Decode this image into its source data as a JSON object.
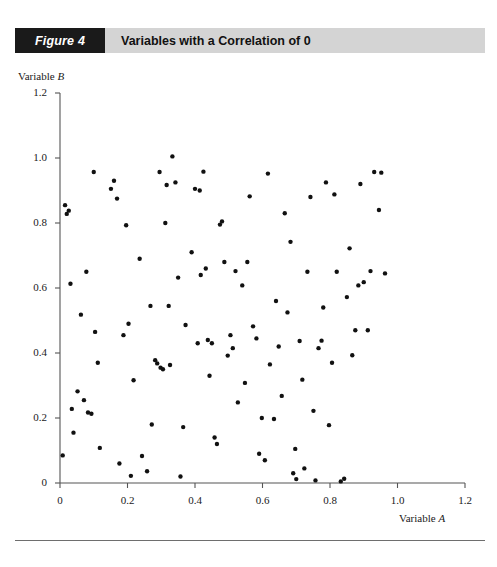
{
  "figure": {
    "number_label": "Figure 4",
    "title": "Variables with a Correlation of 0"
  },
  "chart_data": {
    "type": "scatter",
    "title": "Variables with a Correlation of 0",
    "xlabel": "Variable A",
    "ylabel": "Variable B",
    "xlim": [
      0,
      1.2
    ],
    "ylim": [
      0,
      1.2
    ],
    "grid": false,
    "legend": null,
    "xticks": [
      "0",
      "0.2",
      "0.4",
      "0.6",
      "0.8",
      "1.0",
      "1.2"
    ],
    "xtick_values": [
      0,
      0.2,
      0.4,
      0.6,
      0.8,
      1.0,
      1.2
    ],
    "yticks": [
      "0",
      "0.2",
      "0.4",
      "0.6",
      "0.8",
      "1.0",
      "1.2"
    ],
    "ytick_values": [
      0,
      0.2,
      0.4,
      0.6,
      0.8,
      1.0,
      1.2
    ],
    "marker": {
      "shape": "circle",
      "color": "#111111",
      "size": 4.4
    },
    "points": [
      [
        0.008,
        0.085
      ],
      [
        0.015,
        0.855
      ],
      [
        0.02,
        0.828
      ],
      [
        0.026,
        0.838
      ],
      [
        0.031,
        0.613
      ],
      [
        0.035,
        0.228
      ],
      [
        0.04,
        0.155
      ],
      [
        0.052,
        0.282
      ],
      [
        0.062,
        0.518
      ],
      [
        0.071,
        0.255
      ],
      [
        0.078,
        0.65
      ],
      [
        0.083,
        0.217
      ],
      [
        0.093,
        0.213
      ],
      [
        0.1,
        0.957
      ],
      [
        0.104,
        0.465
      ],
      [
        0.112,
        0.37
      ],
      [
        0.118,
        0.108
      ],
      [
        0.151,
        0.905
      ],
      [
        0.16,
        0.93
      ],
      [
        0.169,
        0.875
      ],
      [
        0.176,
        0.06
      ],
      [
        0.188,
        0.455
      ],
      [
        0.196,
        0.793
      ],
      [
        0.203,
        0.49
      ],
      [
        0.21,
        0.022
      ],
      [
        0.218,
        0.316
      ],
      [
        0.236,
        0.69
      ],
      [
        0.243,
        0.083
      ],
      [
        0.258,
        0.036
      ],
      [
        0.268,
        0.545
      ],
      [
        0.272,
        0.18
      ],
      [
        0.282,
        0.378
      ],
      [
        0.288,
        0.368
      ],
      [
        0.295,
        0.957
      ],
      [
        0.298,
        0.355
      ],
      [
        0.305,
        0.35
      ],
      [
        0.312,
        0.8
      ],
      [
        0.316,
        0.917
      ],
      [
        0.322,
        0.545
      ],
      [
        0.326,
        0.363
      ],
      [
        0.333,
        1.005
      ],
      [
        0.342,
        0.925
      ],
      [
        0.35,
        0.632
      ],
      [
        0.357,
        0.02
      ],
      [
        0.365,
        0.172
      ],
      [
        0.372,
        0.486
      ],
      [
        0.39,
        0.71
      ],
      [
        0.4,
        0.905
      ],
      [
        0.408,
        0.43
      ],
      [
        0.414,
        0.9
      ],
      [
        0.417,
        0.64
      ],
      [
        0.425,
        0.958
      ],
      [
        0.432,
        0.66
      ],
      [
        0.438,
        0.44
      ],
      [
        0.443,
        0.33
      ],
      [
        0.45,
        0.43
      ],
      [
        0.458,
        0.14
      ],
      [
        0.465,
        0.12
      ],
      [
        0.474,
        0.795
      ],
      [
        0.48,
        0.805
      ],
      [
        0.487,
        0.68
      ],
      [
        0.497,
        0.392
      ],
      [
        0.505,
        0.455
      ],
      [
        0.512,
        0.415
      ],
      [
        0.52,
        0.652
      ],
      [
        0.527,
        0.248
      ],
      [
        0.54,
        0.608
      ],
      [
        0.548,
        0.308
      ],
      [
        0.555,
        0.68
      ],
      [
        0.562,
        0.882
      ],
      [
        0.572,
        0.482
      ],
      [
        0.582,
        0.445
      ],
      [
        0.59,
        0.09
      ],
      [
        0.598,
        0.2
      ],
      [
        0.607,
        0.07
      ],
      [
        0.616,
        0.952
      ],
      [
        0.622,
        0.365
      ],
      [
        0.634,
        0.197
      ],
      [
        0.64,
        0.56
      ],
      [
        0.648,
        0.42
      ],
      [
        0.657,
        0.268
      ],
      [
        0.666,
        0.83
      ],
      [
        0.674,
        0.525
      ],
      [
        0.683,
        0.742
      ],
      [
        0.691,
        0.03
      ],
      [
        0.697,
        0.105
      ],
      [
        0.7,
        0.012
      ],
      [
        0.71,
        0.437
      ],
      [
        0.718,
        0.318
      ],
      [
        0.724,
        0.045
      ],
      [
        0.733,
        0.65
      ],
      [
        0.742,
        0.88
      ],
      [
        0.751,
        0.222
      ],
      [
        0.757,
        0.008
      ],
      [
        0.766,
        0.415
      ],
      [
        0.775,
        0.438
      ],
      [
        0.78,
        0.54
      ],
      [
        0.788,
        0.925
      ],
      [
        0.797,
        0.178
      ],
      [
        0.806,
        0.37
      ],
      [
        0.813,
        0.888
      ],
      [
        0.82,
        0.65
      ],
      [
        0.832,
        0.005
      ],
      [
        0.842,
        0.013
      ],
      [
        0.85,
        0.572
      ],
      [
        0.858,
        0.722
      ],
      [
        0.866,
        0.393
      ],
      [
        0.875,
        0.47
      ],
      [
        0.884,
        0.608
      ],
      [
        0.89,
        0.92
      ],
      [
        0.9,
        0.618
      ],
      [
        0.912,
        0.47
      ],
      [
        0.92,
        0.652
      ],
      [
        0.931,
        0.957
      ],
      [
        0.945,
        0.84
      ],
      [
        0.952,
        0.955
      ],
      [
        0.963,
        0.645
      ]
    ]
  },
  "y_axis": {
    "title_prefix": "Variable ",
    "title_var": "B"
  },
  "x_axis": {
    "title_prefix": "Variable ",
    "title_var": "A"
  }
}
